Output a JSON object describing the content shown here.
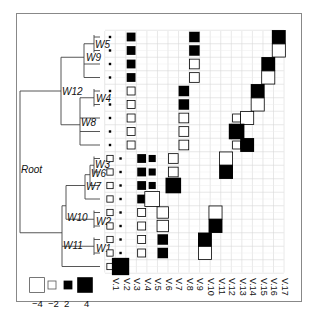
{
  "chart_data": {
    "type": "heatmap",
    "title": "",
    "columns": [
      "V1",
      "V2",
      "V3",
      "V4",
      "V5",
      "V6",
      "V7",
      "V8",
      "V9",
      "V10",
      "V11",
      "V12",
      "V13",
      "V14",
      "V15",
      "V16",
      "V17"
    ],
    "tree_nodes": [
      "Root",
      "W12",
      "W9",
      "W5",
      "W4",
      "W8",
      "W11",
      "W10",
      "W7",
      "W6",
      "W3",
      "W2",
      "W1"
    ],
    "legend": {
      "values": [
        -4,
        -2,
        2,
        4
      ],
      "labels": [
        "−4",
        "−2",
        "2",
        "4"
      ],
      "encoding": "open square = negative, filled square = positive, size = magnitude"
    },
    "rows": [
      {
        "row": 1,
        "cells": [
          {
            "col": "V1",
            "v": 0.5
          },
          {
            "col": "V3",
            "v": 2
          },
          {
            "col": "V9",
            "v": 2.5
          },
          {
            "col": "V17",
            "v": 3.5
          }
        ]
      },
      {
        "row": 2,
        "cells": [
          {
            "col": "V1",
            "v": 0.5
          },
          {
            "col": "V3",
            "v": 2
          },
          {
            "col": "V9",
            "v": 2.5
          },
          {
            "col": "V17",
            "v": -3.5
          }
        ]
      },
      {
        "row": 3,
        "cells": [
          {
            "col": "V1",
            "v": 0.5
          },
          {
            "col": "V3",
            "v": 2
          },
          {
            "col": "V9",
            "v": -2.5
          },
          {
            "col": "V16",
            "v": 3.5
          }
        ]
      },
      {
        "row": 4,
        "cells": [
          {
            "col": "V1",
            "v": 0.5
          },
          {
            "col": "V3",
            "v": 2
          },
          {
            "col": "V9",
            "v": -2.5
          },
          {
            "col": "V16",
            "v": -3.5
          }
        ]
      },
      {
        "row": 5,
        "cells": [
          {
            "col": "V1",
            "v": 0.5
          },
          {
            "col": "V3",
            "v": -2
          },
          {
            "col": "V8",
            "v": 2.5
          },
          {
            "col": "V15",
            "v": 3.5
          }
        ]
      },
      {
        "row": 6,
        "cells": [
          {
            "col": "V1",
            "v": 0.5
          },
          {
            "col": "V3",
            "v": -2
          },
          {
            "col": "V8",
            "v": 2.5
          },
          {
            "col": "V15",
            "v": -3.5
          }
        ]
      },
      {
        "row": 7,
        "cells": [
          {
            "col": "V1",
            "v": 0.5
          },
          {
            "col": "V3",
            "v": -2
          },
          {
            "col": "V8",
            "v": -2.5
          },
          {
            "col": "V13",
            "v": -2
          },
          {
            "col": "V14",
            "v": -3.5
          }
        ]
      },
      {
        "row": 8,
        "cells": [
          {
            "col": "V1",
            "v": 0.5
          },
          {
            "col": "V3",
            "v": -2
          },
          {
            "col": "V8",
            "v": -2.5
          },
          {
            "col": "V13",
            "v": 4
          }
        ]
      },
      {
        "row": 9,
        "cells": [
          {
            "col": "V1",
            "v": 0.5
          },
          {
            "col": "V3",
            "v": -2
          },
          {
            "col": "V8",
            "v": -2.5
          },
          {
            "col": "V13",
            "v": -2
          },
          {
            "col": "V14",
            "v": 3.5
          }
        ]
      },
      {
        "row": 10,
        "cells": [
          {
            "col": "V1",
            "v": -1.5
          },
          {
            "col": "V2",
            "v": 0.5
          },
          {
            "col": "V4",
            "v": 2
          },
          {
            "col": "V5",
            "v": 1.5
          },
          {
            "col": "V7",
            "v": -2.5
          },
          {
            "col": "V12",
            "v": -3.5
          }
        ]
      },
      {
        "row": 11,
        "cells": [
          {
            "col": "V1",
            "v": -1.5
          },
          {
            "col": "V2",
            "v": 0.5
          },
          {
            "col": "V4",
            "v": 2
          },
          {
            "col": "V5",
            "v": 1.5
          },
          {
            "col": "V7",
            "v": -2.5
          },
          {
            "col": "V12",
            "v": 3.5
          }
        ]
      },
      {
        "row": 12,
        "cells": [
          {
            "col": "V1",
            "v": -1.5
          },
          {
            "col": "V2",
            "v": 0.5
          },
          {
            "col": "V4",
            "v": 2
          },
          {
            "col": "V5",
            "v": 1.5
          },
          {
            "col": "V7",
            "v": 4
          }
        ]
      },
      {
        "row": 13,
        "cells": [
          {
            "col": "V1",
            "v": -1.5
          },
          {
            "col": "V2",
            "v": 0.5
          },
          {
            "col": "V4",
            "v": 2
          },
          {
            "col": "V5",
            "v": -4
          }
        ]
      },
      {
        "row": 14,
        "cells": [
          {
            "col": "V1",
            "v": -1.5
          },
          {
            "col": "V2",
            "v": 0.5
          },
          {
            "col": "V4",
            "v": -2
          },
          {
            "col": "V6",
            "v": -3
          },
          {
            "col": "V11",
            "v": -3.5
          }
        ]
      },
      {
        "row": 15,
        "cells": [
          {
            "col": "V1",
            "v": -1.5
          },
          {
            "col": "V2",
            "v": 0.5
          },
          {
            "col": "V4",
            "v": -2
          },
          {
            "col": "V6",
            "v": -3
          },
          {
            "col": "V11",
            "v": 3.5
          }
        ]
      },
      {
        "row": 16,
        "cells": [
          {
            "col": "V1",
            "v": -1.5
          },
          {
            "col": "V2",
            "v": 0.5
          },
          {
            "col": "V4",
            "v": -2
          },
          {
            "col": "V6",
            "v": 2.5
          },
          {
            "col": "V10",
            "v": 3.5
          }
        ]
      },
      {
        "row": 17,
        "cells": [
          {
            "col": "V1",
            "v": -1.5
          },
          {
            "col": "V2",
            "v": 0.5
          },
          {
            "col": "V4",
            "v": -2
          },
          {
            "col": "V6",
            "v": 2.5
          },
          {
            "col": "V10",
            "v": -3.5
          }
        ]
      },
      {
        "row": 18,
        "cells": [
          {
            "col": "V1",
            "v": -1.5
          },
          {
            "col": "V2",
            "v": 4.5
          }
        ]
      }
    ],
    "grid": true
  },
  "colors": {
    "ink": "#000000",
    "grid": "#d8d8d8",
    "tree": "#444444",
    "frame": "#888888"
  }
}
